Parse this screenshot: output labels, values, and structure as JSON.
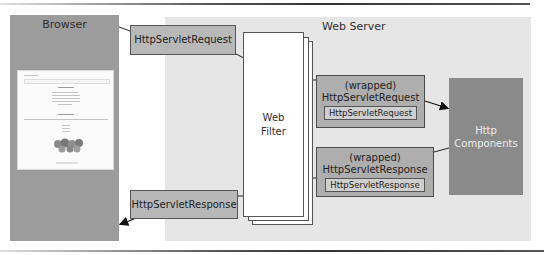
{
  "diagram": {
    "browser": {
      "title": "Browser",
      "color": "#9c9c9c"
    },
    "web_server": {
      "title": "Web Server",
      "color": "#e6e6e6"
    },
    "request_box": {
      "label": "HttpServletRequest"
    },
    "response_box": {
      "label": "HttpServletResponse"
    },
    "web_filter": {
      "line1": "Web",
      "line2": "Filter"
    },
    "wrapped_request": {
      "caption_line1": "(wrapped)",
      "caption_line2": "HttpServletRequest",
      "inner_label": "HttpServletRequest"
    },
    "wrapped_response": {
      "caption_line1": "(wrapped)",
      "caption_line2": "HttpServletResponse",
      "inner_label": "HttpServletResponse"
    },
    "http_components": {
      "line1": "Http",
      "line2": "Components",
      "color": "#8a8a8a"
    },
    "connections": [
      {
        "from": "Browser",
        "to": "HttpServletRequest"
      },
      {
        "from": "HttpServletRequest",
        "to": "Web Filter"
      },
      {
        "from": "Web Filter",
        "to": "(wrapped) HttpServletRequest"
      },
      {
        "from": "(wrapped) HttpServletRequest",
        "to": "Http Components",
        "arrow": true
      },
      {
        "from": "Http Components",
        "to": "(wrapped) HttpServletResponse"
      },
      {
        "from": "(wrapped) HttpServletResponse",
        "to": "Web Filter"
      },
      {
        "from": "Web Filter",
        "to": "HttpServletResponse"
      },
      {
        "from": "HttpServletResponse",
        "to": "Browser",
        "arrow": true
      }
    ]
  }
}
